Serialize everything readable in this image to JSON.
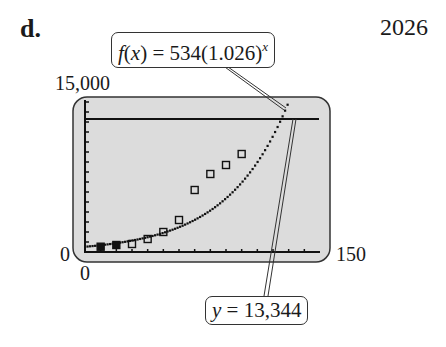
{
  "panel_label": "d.",
  "answer": "2026",
  "callouts": {
    "function": {
      "prefix": "f",
      "arg": "x",
      "text": " = 534(1.026)",
      "exponent": "x"
    },
    "intersection": {
      "var": "y",
      "text": " = 13,344"
    }
  },
  "axes": {
    "y_max_label": "15,000",
    "y_min_label": "0",
    "x_min_label": "0",
    "x_max_label": "150"
  },
  "colors": {
    "screen_bg": "#dcdcdc",
    "ink": "#1a1a1a"
  },
  "chart_data": {
    "type": "scatter",
    "title": "",
    "xlabel": "",
    "ylabel": "",
    "xlim": [
      0,
      150
    ],
    "ylim": [
      0,
      15000
    ],
    "grid": false,
    "series": [
      {
        "name": "data",
        "kind": "scatter",
        "x": [
          10,
          20,
          30,
          40,
          50,
          60,
          70,
          80,
          90,
          100
        ],
        "y": [
          530,
          700,
          800,
          1300,
          2000,
          3200,
          6200,
          7800,
          8700,
          9800
        ]
      },
      {
        "name": "f(x) = 534(1.026)^x",
        "kind": "line",
        "formula": "534*1.026^x"
      },
      {
        "name": "y = 13,344",
        "kind": "hline",
        "y": 13344
      }
    ],
    "annotations": [
      "f(x) = 534(1.026)^x",
      "y = 13,344"
    ]
  }
}
